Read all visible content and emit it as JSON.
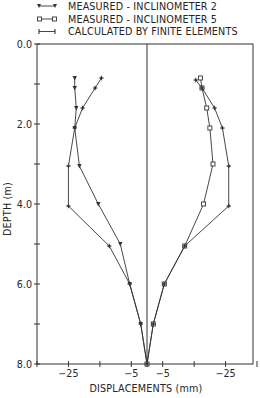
{
  "chart_data": {
    "type": "line",
    "title": "",
    "xlabel": "DISPLACEMENTS (mm)",
    "ylabel": "DEPTH (m)",
    "ylim": [
      0.0,
      8.0
    ],
    "y_inverted": true,
    "xlim_mm_each_side": 35,
    "grid": false,
    "legend_position": "top",
    "legend": [
      {
        "label": "MEASURED - INCLINOMETER 2",
        "marker": "triangle"
      },
      {
        "label": "MEASURED - INCLINOMETER 5",
        "marker": "square"
      },
      {
        "label": "CALCULATED BY FINITE ELEMENTS",
        "marker": "plus"
      }
    ],
    "y_ticks": [
      {
        "value": 0.0,
        "label": "0.0"
      },
      {
        "value": 2.0,
        "label": "2.0"
      },
      {
        "value": 4.0,
        "label": "4.0"
      },
      {
        "value": 6.0,
        "label": "6.0"
      },
      {
        "value": 8.0,
        "label": "8.0"
      }
    ],
    "y_minor_ticks": [
      1.0,
      3.0,
      5.0,
      7.0
    ],
    "x_tick_marks_mm": [
      5,
      15,
      25,
      35
    ],
    "x_ticks": [
      {
        "side": "left",
        "value": -25,
        "label": "-25"
      },
      {
        "side": "left",
        "value": -5,
        "label": "-5"
      },
      {
        "side": "right",
        "value": -5,
        "label": "-5"
      },
      {
        "side": "right",
        "value": -25,
        "label": "-25"
      }
    ],
    "series": [
      {
        "name": "MEASURED - INCLINOMETER 2",
        "side": "left",
        "marker": "triangle",
        "depth": [
          0.85,
          1.1,
          1.6,
          2.1,
          3.05,
          4.0,
          5.0,
          6.0,
          7.0,
          8.0
        ],
        "displacement": [
          -23,
          -23,
          -22.5,
          -23,
          -21.5,
          -15.5,
          -8.5,
          -5.5,
          -2,
          0
        ]
      },
      {
        "name": "CALCULATED BY FINITE ELEMENTS",
        "side": "left",
        "marker": "plus",
        "depth": [
          0.85,
          1.1,
          1.6,
          2.1,
          3.05,
          4.05,
          5.05,
          6.0,
          7.0,
          8.0
        ],
        "displacement": [
          -14.5,
          -16.5,
          -20.5,
          -23,
          -25,
          -25,
          -12,
          -5.5,
          -2,
          0
        ]
      },
      {
        "name": "MEASURED - INCLINOMETER 5",
        "side": "right",
        "marker": "square",
        "depth": [
          0.85,
          1.1,
          1.6,
          2.1,
          3.0,
          4.0,
          5.05,
          6.0,
          7.0,
          8.0
        ],
        "displacement": [
          -17,
          -17.5,
          -19,
          -20,
          -21,
          -18,
          -12,
          -5.5,
          -2,
          0
        ]
      },
      {
        "name": "CALCULATED BY FINITE ELEMENTS",
        "side": "right",
        "marker": "plus",
        "depth": [
          0.9,
          1.1,
          1.6,
          2.1,
          3.05,
          4.05,
          5.05,
          6.0,
          7.0,
          8.0
        ],
        "displacement": [
          -15.5,
          -17.5,
          -21.5,
          -24,
          -26,
          -26,
          -12,
          -5.5,
          -2,
          0
        ]
      }
    ]
  }
}
